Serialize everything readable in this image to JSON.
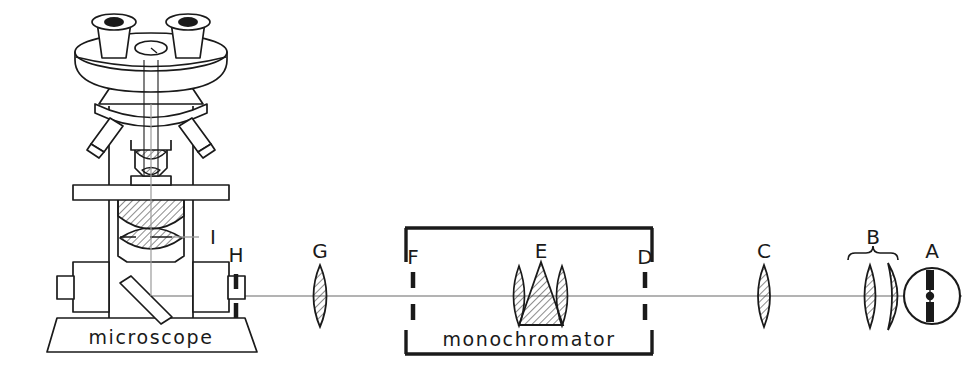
{
  "figure": {
    "width": 972,
    "height": 386,
    "background_color": "#ffffff",
    "ink_color": "#1a1a1a",
    "axis_color": "#8c8c8c",
    "hatch_color": "#2b2b2b",
    "optical_axis_y": 296
  },
  "captions": {
    "microscope": "microscope",
    "monochromator": "monochromator"
  },
  "labels": {
    "a": "A",
    "b": "B",
    "c": "C",
    "d": "D",
    "e": "E",
    "f": "F",
    "g": "G",
    "h": "H",
    "i": "I"
  },
  "components": [
    {
      "id": "A",
      "label": "A",
      "name": "arc-lamp",
      "description": "Arc lamp source: circle with vertical electrodes and central spot",
      "x": 932,
      "y": 296
    },
    {
      "id": "B",
      "label": "B",
      "name": "condensing-lens-pair",
      "description": "Brace over a biconvex lens and a meniscus lens",
      "x": 882,
      "y": 296
    },
    {
      "id": "C",
      "label": "C",
      "name": "collimating-lens",
      "description": "Biconvex lens before the monochromator entrance slit",
      "x": 764,
      "y": 296
    },
    {
      "id": "D",
      "label": "D",
      "name": "entrance-slit",
      "description": "Slit in the right wall of the monochromator",
      "x": 646,
      "y": 296
    },
    {
      "id": "E",
      "label": "E",
      "name": "prism-and-lenses",
      "description": "Dispersing prism flanked by two lenses inside the monochromator",
      "x": 540,
      "y": 296
    },
    {
      "id": "F",
      "label": "F",
      "name": "exit-slit",
      "description": "Slit in the left wall of the monochromator",
      "x": 412,
      "y": 296
    },
    {
      "id": "G",
      "label": "G",
      "name": "relay-lens",
      "description": "Biconvex lens between monochromator and microscope",
      "x": 320,
      "y": 296
    },
    {
      "id": "H",
      "label": "H",
      "name": "microscope-slit",
      "description": "Slit at the microscope illumination entrance",
      "x": 236,
      "y": 296
    },
    {
      "id": "I",
      "label": "I",
      "name": "substage-condenser",
      "description": "Substage condenser under the microscope stage",
      "x": 150,
      "y": 237
    }
  ],
  "instruments": {
    "monochromator": {
      "label": "monochromator",
      "box": {
        "x": 405,
        "y": 227,
        "width": 250,
        "height": 128
      }
    },
    "microscope": {
      "label": "microscope",
      "parts": [
        "binocular-head",
        "eyepiece-tube-left",
        "eyepiece-tube-right",
        "head-dial",
        "objective-turret",
        "objective-lens",
        "specimen-stage",
        "substage-condenser",
        "mirror-45deg",
        "focus-knob-left",
        "focus-knob-right",
        "base"
      ]
    }
  }
}
